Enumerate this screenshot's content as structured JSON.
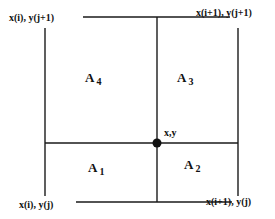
{
  "diagram": {
    "corners": {
      "top_left": "x(i), y(j+1)",
      "top_right": "x(i+1), y(j+1)",
      "bottom_left": "x(i), y(j)",
      "bottom_right": "x(i+1), y(j)"
    },
    "point": "x,y",
    "areas": [
      {
        "letter": "A",
        "sub": "1"
      },
      {
        "letter": "A",
        "sub": "2"
      },
      {
        "letter": "A",
        "sub": "3"
      },
      {
        "letter": "A",
        "sub": "4"
      }
    ],
    "line_color": "#1a1a1a"
  }
}
